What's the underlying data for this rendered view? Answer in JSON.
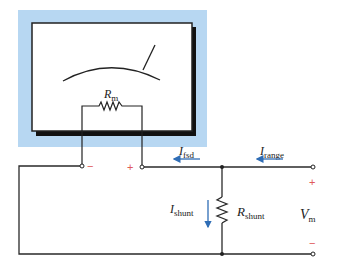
{
  "diagram": {
    "type": "ammeter-shunt-circuit",
    "colors": {
      "meter_background": "#b7d7f2",
      "wire": "#2a2a2a",
      "arrow": "#2f6db5",
      "polarity": "#e05a5a"
    },
    "meter": {
      "resistor_label": "R",
      "resistor_subscript": "m"
    },
    "terminals": {
      "meter_minus": "−",
      "meter_plus": "+",
      "output_plus": "+",
      "output_minus": "−"
    },
    "currents": {
      "fsd": {
        "symbol": "I",
        "subscript": "fsd"
      },
      "range": {
        "symbol": "I",
        "subscript": "range"
      },
      "shunt": {
        "symbol": "I",
        "subscript": "shunt"
      }
    },
    "shunt_resistor": {
      "symbol": "R",
      "subscript": "shunt"
    },
    "voltage": {
      "symbol": "V",
      "subscript": "m"
    }
  }
}
